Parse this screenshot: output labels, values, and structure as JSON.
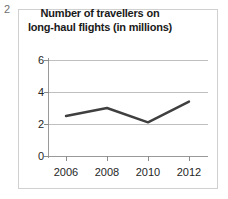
{
  "question_number": "2",
  "chart_data": {
    "type": "line",
    "title": "Number of travellers on long-haul flights (in millions)",
    "title_lines": [
      "Number of travellers on",
      "long-haul flights (in millions)"
    ],
    "xlabel": "",
    "ylabel": "",
    "categories": [
      "2006",
      "2008",
      "2010",
      "2012"
    ],
    "x": [
      2006,
      2008,
      2010,
      2012
    ],
    "values": [
      2.5,
      3.0,
      2.1,
      3.4
    ],
    "series": [
      {
        "name": "Travellers (millions)",
        "values": [
          2.5,
          3.0,
          2.1,
          3.4
        ]
      }
    ],
    "ylim": [
      0,
      6
    ],
    "yticks": [
      "0",
      "2",
      "4",
      "6"
    ],
    "ytick_values": [
      0,
      2,
      4,
      6
    ],
    "xticks": [
      "2006",
      "2008",
      "2010",
      "2012"
    ],
    "grid": true,
    "legend": false,
    "legend_position": "none",
    "line_color": "#3f3f3f",
    "gridline_color": "#bfbfbf",
    "axis_color": "#9a9a9a",
    "border_color": "#d0d0d0",
    "background_color": "#ffffff"
  }
}
